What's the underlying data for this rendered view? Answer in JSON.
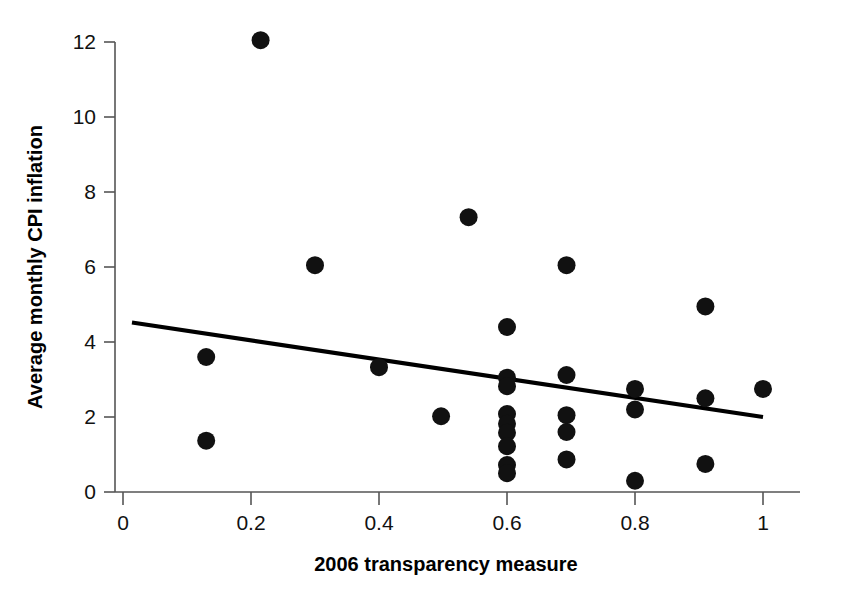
{
  "chart_data": {
    "type": "scatter",
    "title": "",
    "xlabel": "2006 transparency measure",
    "ylabel": "Average monthly CPI inflation",
    "xlim": [
      0,
      1.05
    ],
    "ylim": [
      0,
      12.4
    ],
    "xticks": [
      0,
      0.2,
      0.4,
      0.6,
      0.8,
      1
    ],
    "xtick_labels": [
      "0",
      "0.2",
      "0.4",
      "0.6",
      "0.8",
      "1"
    ],
    "yticks": [
      0,
      2,
      4,
      6,
      8,
      10,
      12
    ],
    "ytick_labels": [
      "0",
      "2",
      "4",
      "6",
      "8",
      "10",
      "12"
    ],
    "grid": false,
    "legend": false,
    "marker_color": "#111111",
    "marker_size_px": 9,
    "points": [
      {
        "x": 0.13,
        "y": 3.6
      },
      {
        "x": 0.13,
        "y": 1.37
      },
      {
        "x": 0.215,
        "y": 12.05
      },
      {
        "x": 0.3,
        "y": 6.05
      },
      {
        "x": 0.4,
        "y": 3.33
      },
      {
        "x": 0.497,
        "y": 2.02
      },
      {
        "x": 0.54,
        "y": 7.33
      },
      {
        "x": 0.6,
        "y": 4.4
      },
      {
        "x": 0.6,
        "y": 3.05
      },
      {
        "x": 0.6,
        "y": 2.82
      },
      {
        "x": 0.6,
        "y": 2.08
      },
      {
        "x": 0.6,
        "y": 1.82
      },
      {
        "x": 0.6,
        "y": 1.58
      },
      {
        "x": 0.6,
        "y": 1.22
      },
      {
        "x": 0.6,
        "y": 0.72
      },
      {
        "x": 0.6,
        "y": 0.5
      },
      {
        "x": 0.693,
        "y": 6.05
      },
      {
        "x": 0.693,
        "y": 3.12
      },
      {
        "x": 0.693,
        "y": 2.05
      },
      {
        "x": 0.693,
        "y": 1.6
      },
      {
        "x": 0.693,
        "y": 0.87
      },
      {
        "x": 0.8,
        "y": 2.75
      },
      {
        "x": 0.8,
        "y": 2.2
      },
      {
        "x": 0.8,
        "y": 0.3
      },
      {
        "x": 0.91,
        "y": 4.95
      },
      {
        "x": 0.91,
        "y": 2.5
      },
      {
        "x": 0.91,
        "y": 0.75
      },
      {
        "x": 1.0,
        "y": 2.75
      }
    ],
    "trend_line": {
      "x0": 0.014,
      "y0": 4.52,
      "x1": 1.0,
      "y1": 2.0,
      "color": "#000000"
    }
  }
}
